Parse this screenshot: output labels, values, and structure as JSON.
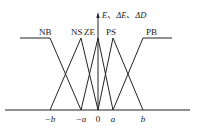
{
  "diagram": {
    "axis_label": "E、ΔE、ΔD",
    "sets": [
      {
        "name": "NB",
        "label": "NB"
      },
      {
        "name": "NS",
        "label": "NS"
      },
      {
        "name": "ZE",
        "label": "ZE"
      },
      {
        "name": "PS",
        "label": "PS"
      },
      {
        "name": "PB",
        "label": "PB"
      }
    ],
    "ticks": [
      {
        "label": "−b"
      },
      {
        "label": "−a"
      },
      {
        "label": "0"
      },
      {
        "label": "a"
      },
      {
        "label": "b"
      }
    ],
    "colors": {
      "line": "#222222",
      "background": "#ffffff"
    }
  }
}
